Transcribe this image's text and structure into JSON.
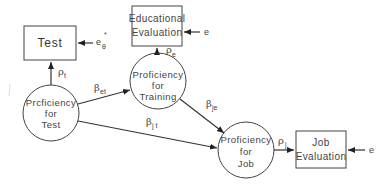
{
  "diagram": {
    "type": "path-diagram",
    "observed": [
      {
        "id": "test",
        "label": "Test",
        "error_label": "e",
        "error_sub": "θ",
        "error_sup": "*"
      },
      {
        "id": "edu_eval",
        "label_lines": [
          "Educational",
          "Evaluation"
        ],
        "error_label": "e"
      },
      {
        "id": "job_eval",
        "label_lines": [
          "Job",
          "Evaluation"
        ],
        "error_label": "e"
      }
    ],
    "latent": [
      {
        "id": "prof_test",
        "label_lines": [
          "Prcficiency",
          "for",
          "Test"
        ]
      },
      {
        "id": "prof_training",
        "label_lines": [
          "Proficiency",
          "for",
          "Training"
        ]
      },
      {
        "id": "prof_job",
        "label_lines": [
          "Proficiency",
          "for",
          "Job"
        ]
      }
    ],
    "paths": [
      {
        "from": "prof_test",
        "to": "test",
        "coef": "ρ",
        "sub": "t"
      },
      {
        "from": "prof_training",
        "to": "edu_eval",
        "coef": "ρ",
        "sub": "e"
      },
      {
        "from": "prof_job",
        "to": "job_eval",
        "coef": "ρ",
        "sub": "j"
      },
      {
        "from": "prof_test",
        "to": "prof_training",
        "coef": "β",
        "sub": "et"
      },
      {
        "from": "prof_training",
        "to": "prof_job",
        "coef": "β",
        "sub": "je"
      },
      {
        "from": "prof_test",
        "to": "prof_job",
        "coef": "β",
        "sub": "j t"
      }
    ]
  }
}
